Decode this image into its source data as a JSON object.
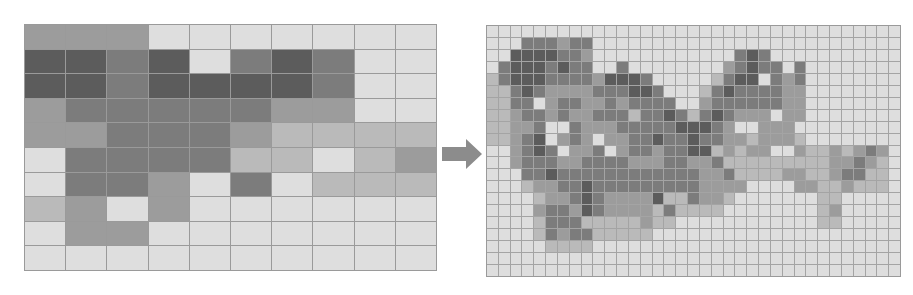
{
  "figure": {
    "arrow": {
      "icon": "right-arrow-icon",
      "color": "#8c8c8c"
    },
    "palette": [
      "#dedede",
      "#bababa",
      "#9c9c9c",
      "#7c7c7c",
      "#5c5c5c"
    ],
    "grid_line_color": "#9a9a9a"
  },
  "left_grid": {
    "cols": 10,
    "rows": 10,
    "levels": [
      [
        2,
        2,
        2,
        0,
        0,
        0,
        0,
        0,
        0,
        0
      ],
      [
        4,
        4,
        3,
        4,
        0,
        3,
        4,
        3,
        0,
        0
      ],
      [
        4,
        4,
        3,
        4,
        4,
        4,
        4,
        3,
        0,
        0
      ],
      [
        2,
        3,
        3,
        3,
        3,
        3,
        2,
        2,
        0,
        0
      ],
      [
        2,
        2,
        3,
        3,
        3,
        2,
        1,
        1,
        1,
        1
      ],
      [
        0,
        3,
        3,
        3,
        3,
        1,
        1,
        0,
        1,
        2
      ],
      [
        0,
        3,
        3,
        2,
        0,
        3,
        0,
        1,
        1,
        1
      ],
      [
        1,
        2,
        0,
        2,
        0,
        0,
        0,
        0,
        0,
        0
      ],
      [
        0,
        2,
        2,
        0,
        0,
        0,
        0,
        0,
        0,
        0
      ],
      [
        0,
        0,
        0,
        0,
        0,
        0,
        0,
        0,
        0,
        0
      ]
    ]
  },
  "right_grid": {
    "cols": 35,
    "rows": 21,
    "levels": [
      [
        0,
        0,
        0,
        0,
        0,
        0,
        0,
        0,
        0,
        0,
        0,
        0,
        0,
        0,
        0,
        0,
        0,
        0,
        0,
        0,
        0,
        0,
        0,
        0,
        0,
        0,
        0,
        0,
        0,
        0,
        0,
        0,
        0,
        0,
        0
      ],
      [
        0,
        0,
        0,
        3,
        3,
        3,
        2,
        3,
        3,
        0,
        0,
        0,
        0,
        0,
        0,
        0,
        0,
        0,
        0,
        0,
        0,
        0,
        0,
        0,
        0,
        0,
        0,
        0,
        0,
        0,
        0,
        0,
        0,
        0,
        0
      ],
      [
        0,
        0,
        4,
        4,
        4,
        4,
        3,
        3,
        2,
        0,
        0,
        0,
        0,
        0,
        0,
        0,
        0,
        0,
        0,
        0,
        0,
        3,
        4,
        3,
        0,
        0,
        0,
        0,
        0,
        0,
        0,
        0,
        0,
        0,
        0
      ],
      [
        0,
        3,
        4,
        4,
        4,
        3,
        4,
        3,
        3,
        0,
        0,
        3,
        0,
        0,
        0,
        0,
        0,
        0,
        0,
        0,
        2,
        3,
        4,
        3,
        3,
        0,
        3,
        0,
        0,
        0,
        0,
        0,
        0,
        0,
        0
      ],
      [
        1,
        3,
        4,
        4,
        4,
        3,
        3,
        3,
        3,
        2,
        4,
        4,
        4,
        3,
        0,
        0,
        0,
        0,
        0,
        1,
        3,
        4,
        4,
        0,
        3,
        2,
        3,
        0,
        0,
        0,
        0,
        0,
        0,
        0,
        0
      ],
      [
        1,
        1,
        3,
        4,
        3,
        2,
        2,
        2,
        2,
        3,
        3,
        3,
        4,
        4,
        3,
        0,
        0,
        0,
        1,
        3,
        4,
        3,
        3,
        3,
        3,
        2,
        2,
        0,
        0,
        0,
        0,
        0,
        0,
        0,
        0
      ],
      [
        1,
        1,
        3,
        3,
        0,
        2,
        3,
        3,
        2,
        2,
        3,
        2,
        3,
        3,
        3,
        3,
        0,
        0,
        2,
        3,
        3,
        3,
        3,
        3,
        3,
        2,
        2,
        0,
        0,
        0,
        0,
        0,
        0,
        0,
        0
      ],
      [
        1,
        1,
        2,
        3,
        3,
        2,
        3,
        2,
        2,
        3,
        3,
        3,
        1,
        3,
        3,
        4,
        3,
        1,
        3,
        4,
        3,
        2,
        2,
        2,
        0,
        2,
        2,
        0,
        0,
        0,
        0,
        0,
        0,
        0,
        0
      ],
      [
        1,
        1,
        2,
        2,
        3,
        0,
        0,
        3,
        2,
        2,
        2,
        3,
        3,
        3,
        3,
        3,
        4,
        4,
        4,
        3,
        2,
        0,
        0,
        2,
        2,
        2,
        0,
        0,
        0,
        0,
        0,
        0,
        0,
        0,
        0
      ],
      [
        1,
        1,
        2,
        3,
        4,
        0,
        2,
        3,
        2,
        0,
        2,
        2,
        3,
        3,
        4,
        3,
        3,
        4,
        3,
        3,
        2,
        2,
        1,
        2,
        2,
        2,
        1,
        0,
        0,
        0,
        0,
        0,
        0,
        0,
        0
      ],
      [
        0,
        0,
        2,
        3,
        4,
        3,
        0,
        2,
        2,
        3,
        0,
        2,
        3,
        3,
        2,
        3,
        3,
        4,
        4,
        1,
        2,
        1,
        2,
        2,
        0,
        0,
        2,
        1,
        1,
        2,
        1,
        2,
        3,
        2,
        0
      ],
      [
        0,
        0,
        2,
        3,
        3,
        3,
        2,
        2,
        3,
        3,
        3,
        3,
        2,
        2,
        2,
        3,
        3,
        2,
        2,
        3,
        1,
        1,
        1,
        1,
        1,
        1,
        1,
        1,
        1,
        2,
        2,
        3,
        2,
        1,
        0
      ],
      [
        0,
        0,
        0,
        3,
        3,
        4,
        3,
        3,
        3,
        3,
        3,
        3,
        3,
        3,
        3,
        3,
        3,
        3,
        2,
        2,
        3,
        1,
        1,
        1,
        1,
        2,
        2,
        1,
        1,
        2,
        3,
        3,
        1,
        1,
        0
      ],
      [
        0,
        0,
        0,
        1,
        2,
        2,
        3,
        3,
        4,
        3,
        3,
        3,
        3,
        3,
        3,
        3,
        3,
        3,
        2,
        2,
        2,
        2,
        0,
        0,
        0,
        0,
        2,
        2,
        1,
        1,
        2,
        1,
        1,
        1,
        0
      ],
      [
        0,
        0,
        0,
        0,
        1,
        2,
        2,
        3,
        4,
        3,
        2,
        2,
        2,
        2,
        4,
        1,
        1,
        3,
        2,
        2,
        1,
        0,
        0,
        0,
        0,
        0,
        0,
        0,
        1,
        1,
        0,
        0,
        0,
        0,
        0
      ],
      [
        0,
        0,
        0,
        0,
        2,
        3,
        3,
        2,
        4,
        3,
        2,
        2,
        2,
        2,
        1,
        3,
        1,
        1,
        1,
        1,
        0,
        0,
        0,
        0,
        0,
        0,
        0,
        0,
        1,
        2,
        0,
        0,
        0,
        0,
        0
      ],
      [
        0,
        0,
        0,
        0,
        1,
        3,
        3,
        3,
        1,
        1,
        1,
        1,
        1,
        2,
        1,
        1,
        0,
        0,
        0,
        0,
        0,
        0,
        0,
        0,
        0,
        0,
        0,
        0,
        1,
        1,
        0,
        0,
        0,
        0,
        0
      ],
      [
        0,
        0,
        0,
        0,
        1,
        3,
        2,
        3,
        3,
        1,
        1,
        1,
        1,
        1,
        0,
        0,
        0,
        0,
        0,
        0,
        0,
        0,
        0,
        0,
        0,
        0,
        0,
        0,
        0,
        0,
        0,
        0,
        0,
        0,
        0
      ],
      [
        0,
        0,
        0,
        0,
        0,
        1,
        1,
        1,
        1,
        0,
        0,
        0,
        0,
        0,
        0,
        0,
        0,
        0,
        0,
        0,
        0,
        0,
        0,
        0,
        0,
        0,
        0,
        0,
        0,
        0,
        0,
        0,
        0,
        0,
        0
      ],
      [
        0,
        0,
        0,
        0,
        0,
        0,
        0,
        0,
        0,
        0,
        0,
        0,
        0,
        0,
        0,
        0,
        0,
        0,
        0,
        0,
        0,
        0,
        0,
        0,
        0,
        0,
        0,
        0,
        0,
        0,
        0,
        0,
        0,
        0,
        0
      ],
      [
        0,
        0,
        0,
        0,
        0,
        0,
        0,
        0,
        0,
        0,
        0,
        0,
        0,
        0,
        0,
        0,
        0,
        0,
        0,
        0,
        0,
        0,
        0,
        0,
        0,
        0,
        0,
        0,
        0,
        0,
        0,
        0,
        0,
        0,
        0
      ]
    ]
  }
}
